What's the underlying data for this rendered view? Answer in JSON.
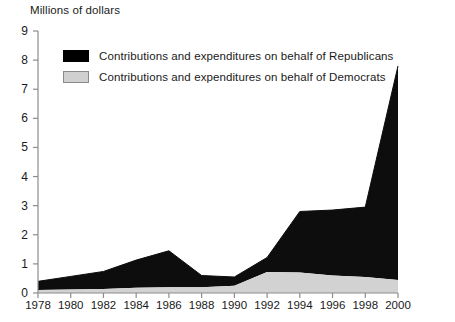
{
  "chart_data": {
    "type": "area",
    "stacked": true,
    "title": "",
    "ylabel": "Millions of dollars",
    "xlabel": "",
    "ylim": [
      0,
      9
    ],
    "yticks": [
      0,
      1,
      2,
      3,
      4,
      5,
      6,
      7,
      8,
      9
    ],
    "xlim": [
      1978,
      2000
    ],
    "x": [
      1978,
      1980,
      1982,
      1984,
      1986,
      1988,
      1990,
      1992,
      1994,
      1996,
      1998,
      2000
    ],
    "categories": [
      "1978",
      "1980",
      "1982",
      "1984",
      "1986",
      "1988",
      "1990",
      "1992",
      "1994",
      "1996",
      "1998",
      "2000"
    ],
    "grid": false,
    "legend_position": "upper-left-inside",
    "series": [
      {
        "name": "Contributions and expenditures on behalf of Republicans",
        "color": "#000000",
        "values": [
          0.3,
          0.45,
          0.6,
          0.95,
          1.25,
          0.4,
          0.3,
          0.5,
          2.1,
          2.25,
          2.4,
          7.35
        ]
      },
      {
        "name": "Contributions and expenditures on behalf of Democrats",
        "color": "#d0d0d0",
        "values": [
          0.1,
          0.12,
          0.14,
          0.18,
          0.2,
          0.2,
          0.25,
          0.72,
          0.7,
          0.6,
          0.55,
          0.45
        ]
      }
    ],
    "totals": [
      0.4,
      0.57,
      0.74,
      1.13,
      1.45,
      0.6,
      0.55,
      1.22,
      2.8,
      2.85,
      2.95,
      7.8
    ]
  },
  "legend": {
    "items": [
      {
        "label": "Contributions and expenditures on behalf of Republicans",
        "swatch": "black"
      },
      {
        "label": "Contributions and expenditures on behalf of Democrats",
        "swatch": "gray"
      }
    ]
  },
  "axis": {
    "y_title": "Millions of dollars"
  }
}
